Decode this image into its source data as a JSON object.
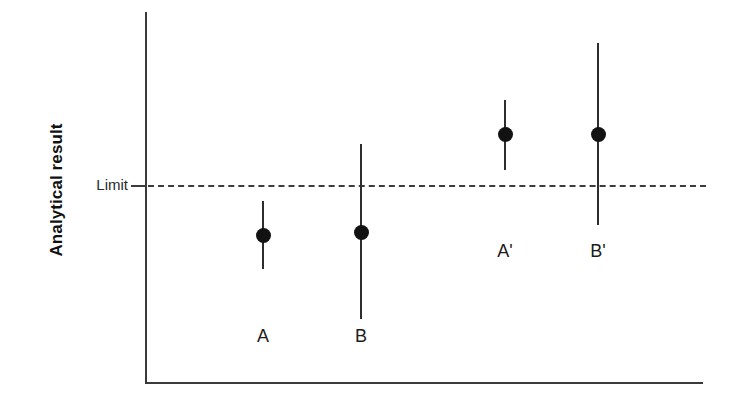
{
  "figure": {
    "width": 729,
    "height": 403,
    "background": "#ffffff",
    "ink_color": "#2d2d2d"
  },
  "axes": {
    "y_title": "Analytical result",
    "x_title": "",
    "y_axis_x_px": 145,
    "x_axis_y_px": 383,
    "tick_labels_x": [],
    "tick_labels_y": [
      "Limit"
    ]
  },
  "limit": {
    "label": "Limit",
    "y_px": 185,
    "style": "dashed",
    "color": "#3c3c3c"
  },
  "chart_data": {
    "type": "scatter",
    "title": "",
    "xlabel": "",
    "ylabel": "Analytical result",
    "grid": false,
    "legend": null,
    "annotations": [
      {
        "text": "Limit",
        "type": "threshold-line",
        "value": 0
      }
    ],
    "ylim": [
      -2.6,
      2.8
    ],
    "xlim": [
      0,
      5
    ],
    "reference_line": {
      "label": "Limit",
      "value": 0
    },
    "categories": [
      "A",
      "B",
      "A'",
      "B'"
    ],
    "x": [
      1.0,
      1.55,
      2.7,
      3.2
    ],
    "values": [
      -0.82,
      -0.76,
      1.07,
      1.07
    ],
    "error_low": [
      -1.45,
      -2.35,
      0.4,
      -0.8
    ],
    "error_high": [
      -0.18,
      0.9,
      1.72,
      2.45
    ],
    "points": [
      {
        "label": "A",
        "x_px": 263,
        "value_y_px": 235,
        "err_top_y_px": 201,
        "err_bottom_y_px": 269,
        "label_y_px": 326,
        "crosses_limit": false
      },
      {
        "label": "B",
        "x_px": 361,
        "value_y_px": 232,
        "err_top_y_px": 144,
        "err_bottom_y_px": 319,
        "label_y_px": 326,
        "crosses_limit": true
      },
      {
        "label": "A'",
        "x_px": 505,
        "value_y_px": 134,
        "err_top_y_px": 100,
        "err_bottom_y_px": 170,
        "label_y_px": 241,
        "crosses_limit": false
      },
      {
        "label": "B'",
        "x_px": 598,
        "value_y_px": 134,
        "err_top_y_px": 43,
        "err_bottom_y_px": 225,
        "label_y_px": 241,
        "crosses_limit": true
      }
    ]
  }
}
